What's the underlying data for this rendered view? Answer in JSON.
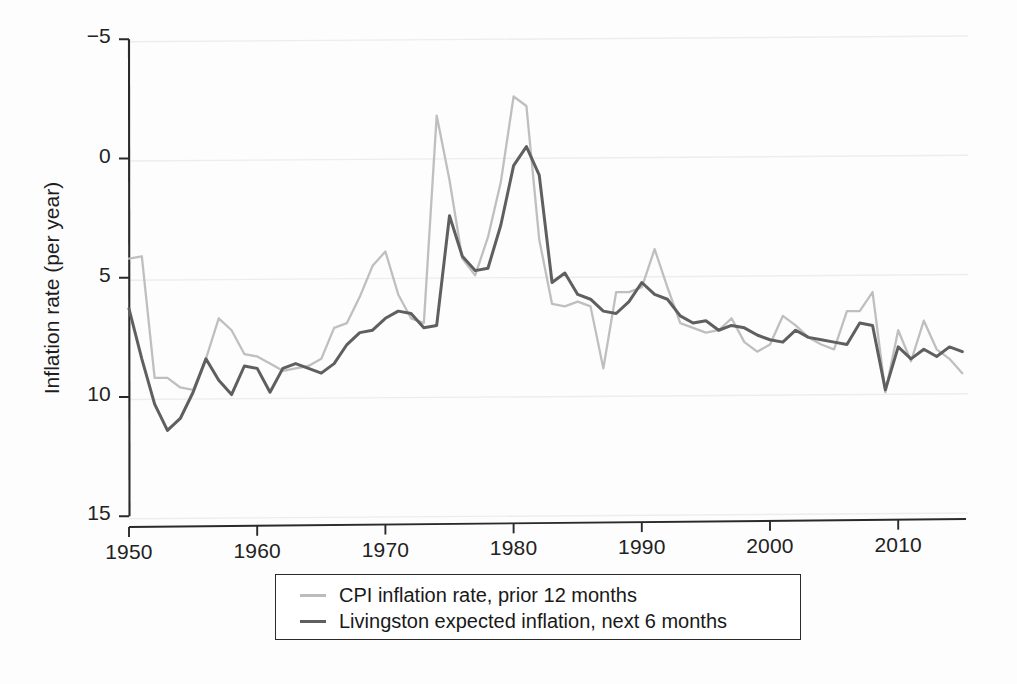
{
  "figure": {
    "background_color": "#fdfdfd"
  },
  "axes": {
    "ylabel": "Inflation rate (per year)",
    "xlabel": "",
    "yticks": [
      "15",
      "10",
      "5",
      "0",
      "−5"
    ],
    "xticks": [
      "1950",
      "1960",
      "1970",
      "1980",
      "1990",
      "2000",
      "2010"
    ]
  },
  "legend": {
    "items": [
      {
        "label": "CPI inflation rate, prior 12 months",
        "color": "#bcbcbc"
      },
      {
        "label": "Livingston expected inflation, next 6 months",
        "color": "#5f5f5f"
      }
    ]
  },
  "colors": {
    "cpi_line": "#bcbcbc",
    "livingston_line": "#5f5f5f",
    "axis": "#2a2a2a",
    "gridline": "#ededed",
    "text": "#1e1e1e"
  },
  "chart_data": {
    "type": "line",
    "title": "",
    "xlabel": "",
    "ylabel": "Inflation rate (per year)",
    "xlim": [
      1949,
      2016
    ],
    "ylim": [
      -5,
      15
    ],
    "yticks": [
      -5,
      0,
      5,
      10,
      15
    ],
    "xticks": [
      1950,
      1960,
      1970,
      1980,
      1990,
      2000,
      2010
    ],
    "grid": "horizontal",
    "legend_position": "below-axes",
    "x": [
      1950,
      1951,
      1952,
      1953,
      1954,
      1955,
      1956,
      1957,
      1958,
      1959,
      1960,
      1961,
      1962,
      1963,
      1964,
      1965,
      1966,
      1967,
      1968,
      1969,
      1970,
      1971,
      1972,
      1973,
      1974,
      1975,
      1976,
      1977,
      1978,
      1979,
      1980,
      1981,
      1982,
      1983,
      1984,
      1985,
      1986,
      1987,
      1988,
      1989,
      1990,
      1991,
      1992,
      1993,
      1994,
      1995,
      1996,
      1997,
      1998,
      1999,
      2000,
      2001,
      2002,
      2003,
      2004,
      2005,
      2006,
      2007,
      2008,
      2009,
      2010,
      2011,
      2012,
      2013,
      2014,
      2015
    ],
    "series": [
      {
        "name": "CPI inflation rate, prior 12 months",
        "color": "#bcbcbc",
        "values": [
          5.8,
          5.9,
          0.8,
          0.8,
          0.4,
          0.3,
          1.6,
          3.3,
          2.8,
          1.8,
          1.7,
          1.4,
          1.1,
          1.2,
          1.3,
          1.6,
          2.9,
          3.1,
          4.2,
          5.5,
          6.1,
          4.3,
          3.3,
          3.1,
          11.8,
          9.1,
          5.8,
          5.1,
          6.7,
          9.0,
          12.6,
          12.2,
          6.6,
          3.9,
          3.8,
          4.0,
          3.8,
          1.2,
          4.4,
          4.4,
          4.6,
          6.2,
          4.6,
          3.1,
          2.9,
          2.7,
          2.8,
          3.3,
          2.3,
          1.9,
          2.2,
          3.4,
          3.0,
          2.5,
          2.2,
          2.0,
          3.6,
          3.6,
          4.4,
          0.2,
          2.8,
          1.5,
          3.2,
          2.0,
          1.6,
          1.0
        ]
      },
      {
        "name": "Livingston expected inflation, next 6 months",
        "color": "#5f5f5f",
        "values": [
          3.7,
          1.6,
          -0.3,
          -1.4,
          -0.9,
          0.2,
          1.6,
          0.7,
          0.1,
          1.3,
          1.2,
          0.2,
          1.2,
          1.4,
          1.2,
          1.0,
          1.4,
          2.2,
          2.7,
          2.8,
          3.3,
          3.6,
          3.5,
          2.9,
          3.0,
          7.6,
          5.9,
          5.3,
          5.4,
          7.2,
          9.7,
          10.5,
          9.3,
          4.8,
          5.2,
          4.3,
          4.1,
          3.6,
          3.5,
          4.0,
          4.8,
          4.3,
          4.1,
          3.4,
          3.1,
          3.2,
          2.8,
          3.0,
          2.9,
          2.6,
          2.4,
          2.3,
          2.8,
          2.5,
          2.4,
          2.3,
          2.2,
          3.1,
          3.0,
          0.3,
          2.1,
          1.6,
          2.0,
          1.7,
          2.1,
          1.9
        ]
      }
    ]
  }
}
